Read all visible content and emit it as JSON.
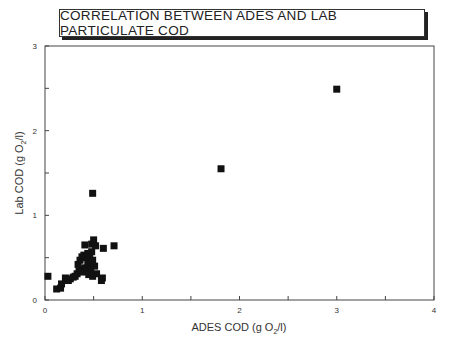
{
  "chart_data": {
    "type": "scatter",
    "title": "CORRELATION BETWEEN ADES AND LAB PARTICULATE COD",
    "xlabel": "ADES COD (g O2/l)",
    "ylabel": "Lab COD (g O2/l)",
    "xlim": [
      0,
      4
    ],
    "ylim": [
      0,
      3
    ],
    "x_ticks": [
      0,
      1,
      2,
      3,
      4
    ],
    "y_ticks": [
      0,
      1,
      2,
      3
    ],
    "grid": false,
    "legend": null,
    "marker": "square",
    "series": [
      {
        "name": "samples",
        "points": [
          [
            0.03,
            0.28
          ],
          [
            0.12,
            0.13
          ],
          [
            0.16,
            0.14
          ],
          [
            0.17,
            0.19
          ],
          [
            0.21,
            0.26
          ],
          [
            0.24,
            0.23
          ],
          [
            0.26,
            0.25
          ],
          [
            0.29,
            0.27
          ],
          [
            0.31,
            0.28
          ],
          [
            0.33,
            0.31
          ],
          [
            0.35,
            0.34
          ],
          [
            0.37,
            0.36
          ],
          [
            0.39,
            0.33
          ],
          [
            0.41,
            0.38
          ],
          [
            0.43,
            0.36
          ],
          [
            0.34,
            0.42
          ],
          [
            0.36,
            0.47
          ],
          [
            0.38,
            0.51
          ],
          [
            0.4,
            0.53
          ],
          [
            0.42,
            0.5
          ],
          [
            0.44,
            0.55
          ],
          [
            0.46,
            0.52
          ],
          [
            0.48,
            0.57
          ],
          [
            0.41,
            0.65
          ],
          [
            0.48,
            0.66
          ],
          [
            0.5,
            0.71
          ],
          [
            0.52,
            0.64
          ],
          [
            0.6,
            0.61
          ],
          [
            0.71,
            0.64
          ],
          [
            0.44,
            0.45
          ],
          [
            0.46,
            0.42
          ],
          [
            0.49,
            0.47
          ],
          [
            0.51,
            0.4
          ],
          [
            0.47,
            0.36
          ],
          [
            0.45,
            0.3
          ],
          [
            0.49,
            0.28
          ],
          [
            0.53,
            0.31
          ],
          [
            0.59,
            0.26
          ],
          [
            0.58,
            0.23
          ],
          [
            0.49,
            1.26
          ],
          [
            1.81,
            1.55
          ],
          [
            3.0,
            2.49
          ]
        ]
      }
    ]
  },
  "labels": {
    "title": "CORRELATION BETWEEN ADES AND LAB PARTICULATE COD",
    "x_axis_main": "ADES COD (g O",
    "x_axis_sub": "2",
    "x_axis_end": "/l)",
    "y_axis_main": "Lab COD (g O",
    "y_axis_sub": "2",
    "y_axis_end": "/l)"
  }
}
